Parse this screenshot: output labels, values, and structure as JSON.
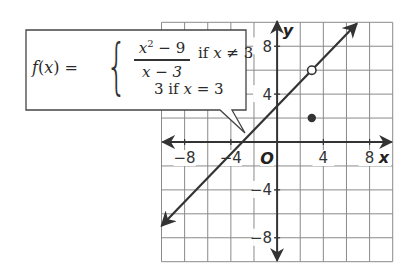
{
  "chart_data": {
    "type": "line",
    "title": "",
    "function_label": "f(x)",
    "piecewise": [
      {
        "expression": "(x^2 - 9)/(x - 3)",
        "numerator": "x² − 9",
        "denominator": "x − 3",
        "condition": "if x ≠ 3"
      },
      {
        "expression": "3",
        "value": "3",
        "condition": "if x = 3"
      }
    ],
    "series": [
      {
        "name": "y = x + 3 (graph of f for x ≠ 3)",
        "kind": "line-with-arrows",
        "slope": 1,
        "intercept": 3,
        "x": [
          -10,
          6.9
        ],
        "y": [
          -7,
          9.9
        ]
      }
    ],
    "points": [
      {
        "name": "hole",
        "x": 3,
        "y": 6,
        "style": "open-circle"
      },
      {
        "name": "defined-point",
        "x": 3,
        "y": 2,
        "style": "filled-circle"
      }
    ],
    "xlabel": "x",
    "ylabel": "y",
    "origin_label": "O",
    "xlim": [
      -10,
      10
    ],
    "ylim": [
      -10,
      10
    ],
    "grid": true,
    "grid_step": 2,
    "x_tick_labels": [
      {
        "value": -8,
        "label": "−8"
      },
      {
        "value": -4,
        "label": "−4"
      },
      {
        "value": 4,
        "label": "4"
      },
      {
        "value": 8,
        "label": "8"
      }
    ],
    "y_tick_labels": [
      {
        "value": 8,
        "label": "8"
      },
      {
        "value": 4,
        "label": "4"
      },
      {
        "value": -4,
        "label": "−4"
      },
      {
        "value": -8,
        "label": "−8"
      }
    ]
  },
  "callout": {
    "lhs": "f(x) =",
    "brace": "{",
    "numerator": "x",
    "numerator_exp": "2",
    "numerator_rest": " − 9",
    "denominator": "x − 3",
    "case1_if": "if ",
    "case1_var": "x",
    "case1_rel": " ≠ 3",
    "case2_val": "3 if ",
    "case2_var": "x",
    "case2_rel": " = 3"
  },
  "colors": {
    "grid": "#8a8a8a",
    "axis": "#333333",
    "line": "#333333",
    "background": "#ffffff",
    "callout_border": "#444444"
  }
}
